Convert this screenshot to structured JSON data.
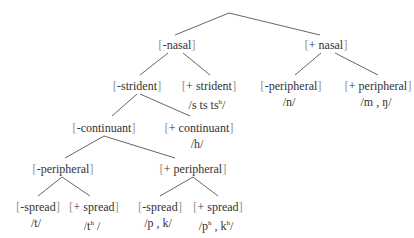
{
  "tree": {
    "root": {
      "x": 229,
      "y": 13
    },
    "nodes": [
      {
        "id": "minus-nasal",
        "label": "-nasal",
        "x": 177,
        "y": 38
      },
      {
        "id": "plus-nasal",
        "label": "+ nasal",
        "x": 326,
        "y": 38
      },
      {
        "id": "minus-strident",
        "label": "-strident",
        "x": 137,
        "y": 79
      },
      {
        "id": "plus-strident",
        "label": "+ strident",
        "x": 209,
        "y": 79,
        "segments": "/s  ts  ts",
        "segments_sup": "h",
        "segments_end": "/"
      },
      {
        "id": "minus-peripheral-nasal",
        "label": "-peripheral",
        "x": 291,
        "y": 79,
        "segments": "/n/"
      },
      {
        "id": "plus-peripheral-nasal",
        "label": "+ peripheral",
        "x": 378,
        "y": 79,
        "segments": "/m , ŋ/"
      },
      {
        "id": "minus-continuant",
        "label": "-continuant",
        "x": 104,
        "y": 121
      },
      {
        "id": "plus-continuant",
        "label": "+ continuant",
        "x": 199,
        "y": 121,
        "segments": "/h/"
      },
      {
        "id": "minus-peripheral-oral",
        "label": "-peripheral",
        "x": 63,
        "y": 162
      },
      {
        "id": "plus-peripheral-oral",
        "label": "+ peripheral",
        "x": 193,
        "y": 162
      },
      {
        "id": "minus-spread-t",
        "label": "-spread",
        "x": 38,
        "y": 200,
        "segments": "/t/"
      },
      {
        "id": "plus-spread-t",
        "label": "+ spread",
        "x": 94,
        "y": 200,
        "segments": "/t",
        "segments_sup": "h",
        "segments_end": " /"
      },
      {
        "id": "minus-spread-pk",
        "label": "-spread",
        "x": 160,
        "y": 200,
        "segments": "/p , k/"
      },
      {
        "id": "plus-spread-pk",
        "label": "+ spread",
        "x": 218,
        "y": 200,
        "segments": "/p",
        "segments_sup": "h",
        "segments_mid": " , k",
        "segments_sup2": "h",
        "segments_end": "/"
      }
    ],
    "edges": [
      [
        229,
        13,
        175,
        35
      ],
      [
        229,
        13,
        320,
        35
      ],
      [
        168,
        53,
        140,
        75
      ],
      [
        183,
        53,
        210,
        75
      ],
      [
        321,
        53,
        295,
        75
      ],
      [
        335,
        53,
        378,
        75
      ],
      [
        137,
        94,
        112,
        116
      ],
      [
        140,
        94,
        190,
        116
      ],
      [
        104,
        136,
        65,
        158
      ],
      [
        104,
        136,
        175,
        158
      ],
      [
        62,
        177,
        38,
        196
      ],
      [
        62,
        177,
        90,
        196
      ],
      [
        193,
        177,
        160,
        196
      ],
      [
        193,
        177,
        218,
        196
      ]
    ],
    "brackets": {
      "open": "[",
      "close": "]"
    }
  }
}
